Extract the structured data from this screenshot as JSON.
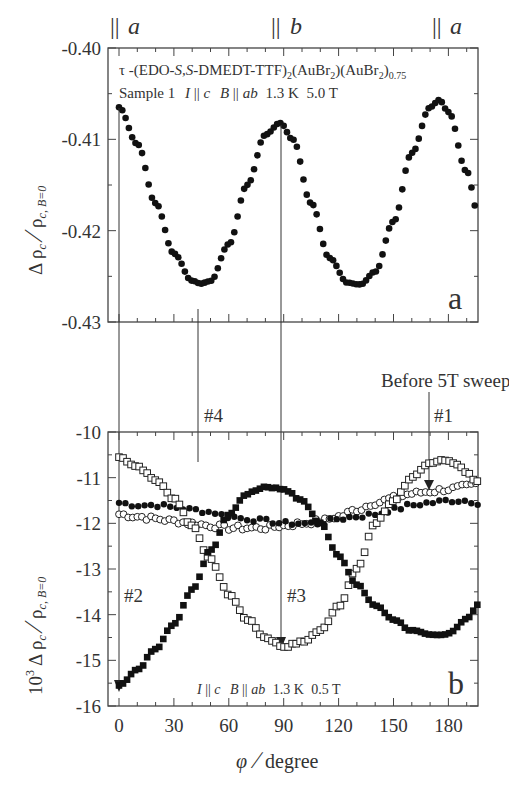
{
  "chart_data": [
    {
      "type": "scatter",
      "panel": "a",
      "panel_label": "a",
      "title_line1": "τ -(EDO-S,S-DMEDT-TTF)2(AuBr2)(AuBr2)0.75",
      "title_line2": "Sample 1  I || c  B || ab  1.3 K  5.0 T",
      "ylabel": "Δ ρc / ρc, B=0",
      "xlabel": "",
      "xlim": [
        -6,
        196
      ],
      "ylim": [
        -0.43,
        -0.4
      ],
      "yticks": [
        "-0.40",
        "-0.41",
        "-0.42",
        "-0.43"
      ],
      "yticks_values": [
        -0.4,
        -0.41,
        -0.42,
        -0.43
      ],
      "top_axis_labels": [
        {
          "text": "|| a",
          "x": 0
        },
        {
          "text": "|| b",
          "x": 90
        },
        {
          "text": "|| a",
          "x": 180
        }
      ],
      "grid": false,
      "series": [
        {
          "name": "5.0 T rotation",
          "marker": "filled-circle",
          "x": [
            0,
            10,
            20,
            30,
            40,
            45,
            50,
            60,
            70,
            80,
            88,
            95,
            105,
            115,
            125,
            132,
            140,
            150,
            160,
            170,
            175,
            180,
            190,
            196
          ],
          "y": [
            -0.4065,
            -0.4105,
            -0.417,
            -0.4225,
            -0.4255,
            -0.4258,
            -0.4255,
            -0.4215,
            -0.415,
            -0.4095,
            -0.4082,
            -0.41,
            -0.417,
            -0.423,
            -0.4257,
            -0.4259,
            -0.4245,
            -0.419,
            -0.4115,
            -0.4065,
            -0.4057,
            -0.407,
            -0.4135,
            -0.418
          ]
        }
      ],
      "annotations": [
        {
          "text": "#4",
          "x": 43,
          "arrow_to_panel": "b"
        },
        {
          "text": "#3",
          "x": 88,
          "arrow_to_panel": "b"
        },
        {
          "text": "#2",
          "x": 0,
          "arrow_to_panel": "b"
        }
      ]
    },
    {
      "type": "scatter",
      "panel": "b",
      "panel_label": "b",
      "condition_label": "I || c  B || ab  1.3 K  0.5 T",
      "ylabel": "10³ Δ ρc / ρc, B=0",
      "xlabel": "φ / degree",
      "xlim": [
        -6,
        196
      ],
      "ylim": [
        -16,
        -10
      ],
      "xticks": [
        "0",
        "30",
        "60",
        "90",
        "120",
        "150",
        "180"
      ],
      "xticks_values": [
        0,
        30,
        60,
        90,
        120,
        150,
        180
      ],
      "yticks": [
        "-10",
        "-11",
        "-12",
        "-13",
        "-14",
        "-15",
        "-16"
      ],
      "yticks_values": [
        -10,
        -11,
        -12,
        -13,
        -14,
        -15,
        -16
      ],
      "grid": false,
      "series": [
        {
          "name": "#2 (after sweep, starting 0°)",
          "marker": "filled-square",
          "x": [
            0,
            10,
            20,
            30,
            40,
            50,
            60,
            70,
            80,
            90,
            100,
            110,
            120,
            130,
            140,
            150,
            160,
            170,
            175,
            180,
            190,
            196
          ],
          "y": [
            -15.55,
            -15.2,
            -14.75,
            -14.2,
            -13.45,
            -12.6,
            -11.8,
            -11.35,
            -11.2,
            -11.25,
            -11.5,
            -12.0,
            -12.7,
            -13.35,
            -13.8,
            -14.1,
            -14.35,
            -14.45,
            -14.45,
            -14.4,
            -14.1,
            -13.8
          ]
        },
        {
          "name": "#3",
          "marker": "open-square",
          "x": [
            0,
            10,
            20,
            30,
            40,
            50,
            60,
            70,
            80,
            90,
            100,
            110,
            120,
            130,
            140,
            150,
            160,
            170,
            178,
            185,
            190,
            196
          ],
          "y": [
            -10.55,
            -10.75,
            -11.05,
            -11.45,
            -12.05,
            -12.8,
            -13.55,
            -14.1,
            -14.5,
            -14.7,
            -14.6,
            -14.35,
            -13.8,
            -13.0,
            -12.0,
            -11.5,
            -11.0,
            -10.7,
            -10.6,
            -10.7,
            -10.9,
            -11.1
          ]
        },
        {
          "name": "#4",
          "marker": "filled-circle",
          "x": [
            0,
            10,
            20,
            30,
            40,
            50,
            60,
            70,
            80,
            90,
            100,
            110,
            120,
            130,
            140,
            150,
            160,
            170,
            180,
            190,
            196
          ],
          "y": [
            -11.55,
            -11.6,
            -11.6,
            -11.65,
            -11.7,
            -11.75,
            -11.85,
            -11.9,
            -11.95,
            -12.0,
            -12.0,
            -12.0,
            -11.9,
            -11.85,
            -11.8,
            -11.7,
            -11.6,
            -11.55,
            -11.5,
            -11.5,
            -11.55
          ]
        },
        {
          "name": "#1 (Before 5T sweep)",
          "marker": "open-circle",
          "x": [
            0,
            10,
            20,
            30,
            40,
            50,
            60,
            70,
            80,
            90,
            100,
            110,
            120,
            130,
            140,
            150,
            160,
            170,
            180,
            190,
            196
          ],
          "y": [
            -11.8,
            -11.85,
            -11.9,
            -11.95,
            -12.0,
            -12.05,
            -12.1,
            -12.1,
            -12.1,
            -12.05,
            -12.0,
            -11.95,
            -11.85,
            -11.7,
            -11.55,
            -11.45,
            -11.35,
            -11.3,
            -11.25,
            -11.2,
            -11.15
          ]
        }
      ],
      "annotations": [
        {
          "text": "#1",
          "x": 172
        },
        {
          "text": "#2",
          "x": 5
        },
        {
          "text": "#3",
          "x": 93
        },
        {
          "text": "#4",
          "x": 45
        },
        {
          "text": "Before 5T sweep",
          "x": 170
        }
      ]
    }
  ],
  "figure": {
    "top_labels": {
      "a_left": "a",
      "b_mid": "b",
      "a_right": "a",
      "parallel": "||"
    },
    "panel_a": {
      "label": "a",
      "title_tau": "τ",
      "title_main": "-(EDO-",
      "title_ss": "S,S",
      "title_rest": "-DMEDT-TTF)",
      "sub2": "2",
      "au1": "(AuBr",
      "au1_close": ")(AuBr",
      "au2_close": ")",
      "sub075": "0.75",
      "line2_sample": "Sample 1",
      "line2_I": "I",
      "line2_par": "||",
      "line2_c": "c",
      "line2_B": "B",
      "line2_ab": "ab",
      "line2_temp": "1.3 K",
      "line2_field": "5.0 T",
      "ylabel_delta": "Δ ρ",
      "ylabel_sub": "c",
      "ylabel_slash": "∕",
      "ylabel_rho": "ρ",
      "ylabel_sub2": "c, B=0",
      "yticks": [
        "-0.40",
        "-0.41",
        "-0.42",
        "-0.43"
      ]
    },
    "panel_b": {
      "label": "b",
      "cond_I": "I",
      "cond_par": "||",
      "cond_c": "c",
      "cond_B": "B",
      "cond_ab": "ab",
      "cond_temp": "1.3 K",
      "cond_field": "0.5 T",
      "ylabel_pre": "10",
      "ylabel_exp": "3",
      "ylabel_delta": "Δ ρ",
      "ylabel_sub": "c",
      "ylabel_slash": "∕",
      "ylabel_rho": "ρ",
      "ylabel_sub2": "c, B=0",
      "yticks": [
        "-10",
        "-11",
        "-12",
        "-13",
        "-14",
        "-15",
        "-16"
      ],
      "xticks": [
        "0",
        "30",
        "60",
        "90",
        "120",
        "150",
        "180"
      ],
      "xlabel_phi": "φ",
      "xlabel_slash": "∕",
      "xlabel_unit": "degree",
      "ann_1": "#1",
      "ann_2": "#2",
      "ann_3": "#3",
      "ann_4": "#4",
      "ann_before": "Before 5T sweep"
    }
  }
}
